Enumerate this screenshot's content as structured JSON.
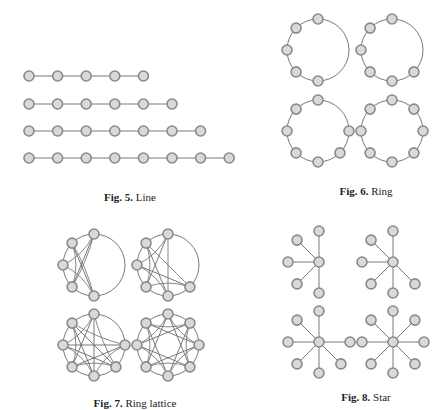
{
  "style": {
    "edge_color": "#6a6a6a",
    "node_fill": "#d9d9d9",
    "node_stroke": "#8a8a8a",
    "node_radius": 5
  },
  "figures": [
    {
      "id": "fig5",
      "label": "Fig. 5.",
      "title": "Line",
      "caption_pos": [
        130,
        198
      ],
      "type": "line",
      "graphs": [
        {
          "nodes": 5,
          "y": 76
        },
        {
          "nodes": 6,
          "y": 104
        },
        {
          "nodes": 7,
          "y": 131
        },
        {
          "nodes": 8,
          "y": 158
        }
      ],
      "x_start": 29,
      "spacing": 28.6
    },
    {
      "id": "fig6",
      "label": "Fig. 6.",
      "title": "Ring",
      "caption_pos": [
        366,
        192
      ],
      "type": "ring",
      "graphs": [
        {
          "nodes": 5,
          "cx": 318,
          "cy": 50,
          "r": 31
        },
        {
          "nodes": 6,
          "cx": 392,
          "cy": 50,
          "r": 31
        },
        {
          "nodes": 7,
          "cx": 318,
          "cy": 131,
          "r": 31
        },
        {
          "nodes": 8,
          "cx": 392,
          "cy": 131,
          "r": 31
        }
      ]
    },
    {
      "id": "fig7",
      "label": "Fig. 7.",
      "title": "Ring lattice",
      "caption_pos": [
        135,
        404
      ],
      "type": "ring_lattice",
      "graphs": [
        {
          "nodes": 5,
          "cx": 94,
          "cy": 265,
          "r": 31
        },
        {
          "nodes": 6,
          "cx": 168,
          "cy": 265,
          "r": 31
        },
        {
          "nodes": 7,
          "cx": 94,
          "cy": 345,
          "r": 31
        },
        {
          "nodes": 8,
          "cx": 168,
          "cy": 345,
          "r": 31
        }
      ]
    },
    {
      "id": "fig8",
      "label": "Fig. 8.",
      "title": "Star",
      "caption_pos": [
        366,
        398
      ],
      "type": "star",
      "graphs": [
        {
          "leaves": 5,
          "cx": 319,
          "cy": 262,
          "r": 31
        },
        {
          "leaves": 6,
          "cx": 393,
          "cy": 262,
          "r": 31
        },
        {
          "leaves": 7,
          "cx": 319,
          "cy": 342,
          "r": 31
        },
        {
          "leaves": 8,
          "cx": 393,
          "cy": 342,
          "r": 31
        }
      ]
    }
  ]
}
